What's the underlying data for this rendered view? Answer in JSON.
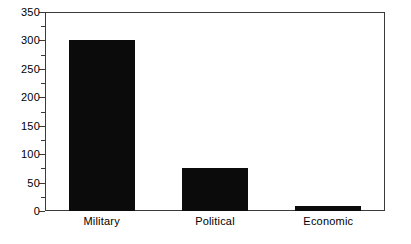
{
  "chart_data": {
    "type": "bar",
    "title": "",
    "subtitle": "",
    "xlabel": "",
    "ylabel": "",
    "categories": [
      "Military",
      "Political",
      "Economic"
    ],
    "values": [
      300,
      75,
      8
    ],
    "series": [
      {
        "name": "",
        "values": [
          300,
          75,
          8
        ]
      }
    ],
    "ylim": [
      0,
      350
    ],
    "y_ticks": [
      0,
      50,
      100,
      150,
      200,
      250,
      300,
      350
    ],
    "y_tick_labels": [
      "0",
      "50",
      "100",
      "150",
      "200",
      "250",
      "300",
      "350"
    ],
    "y_minor_ticks": [
      25,
      75,
      125,
      175,
      225,
      275,
      325
    ],
    "grid": false,
    "legend": null,
    "legend_position": "none",
    "annotations": [],
    "bar_color": "#0b0b0b",
    "frame_color": "#3a3a3a",
    "background_color": "#ffffff",
    "orientation": "vertical"
  }
}
